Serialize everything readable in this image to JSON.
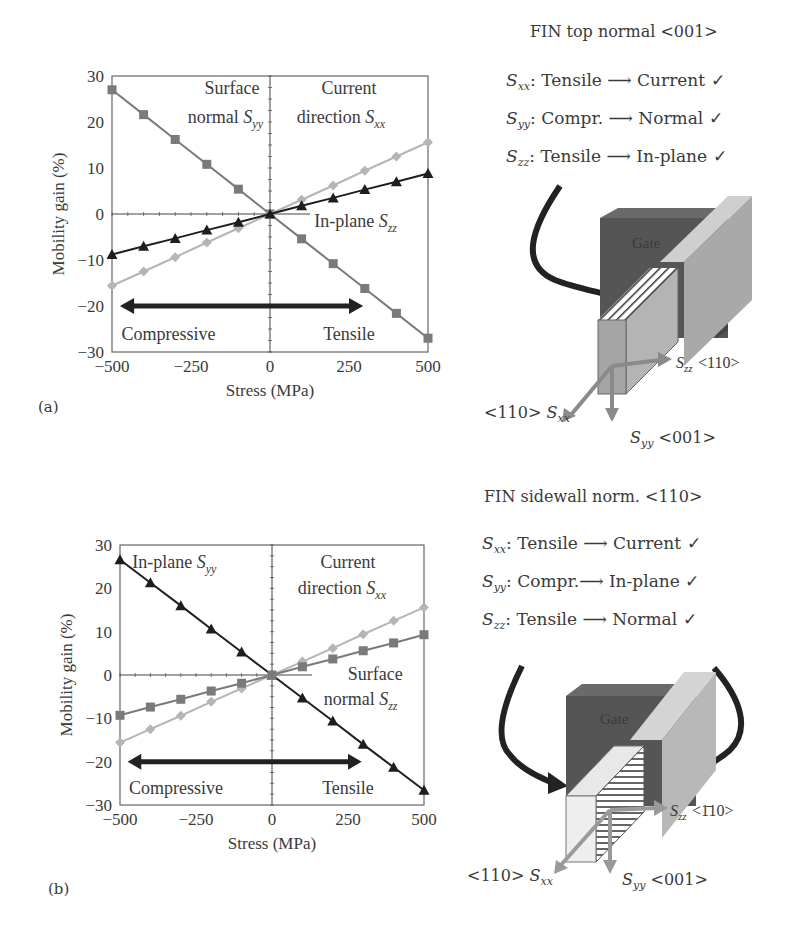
{
  "panels": [
    {
      "label": "(a)",
      "chart": {
        "ylabel": "Mobility gain (%)",
        "xlabel": "Stress (MPa)",
        "xticks": [
          "-500",
          "-250",
          "0",
          "250",
          "500"
        ],
        "yticks": [
          "30",
          "20",
          "10",
          "0",
          "-10",
          "-20",
          "-30"
        ],
        "annotations": {
          "upper_left_1": "Surface",
          "upper_left_2": "normal S",
          "upper_left_sub": "yy",
          "upper_right_1": "Current",
          "upper_right_2": "direction S",
          "upper_right_sub": "xx",
          "mid_right": "In-plane S",
          "mid_right_sub": "zz",
          "compressive": "Compressive",
          "tensile": "Tensile"
        }
      },
      "diagram": {
        "title": "FIN top normal <001>",
        "rules": [
          {
            "s": "S",
            "sub": "xx",
            "text": ": Tensile ⟶ Current ✓"
          },
          {
            "s": "S",
            "sub": "yy",
            "text": ": Compr. ⟶ Normal  ✓"
          },
          {
            "s": "S",
            "sub": "zz",
            "text": ": Tensile ⟶ In-plane ✓"
          }
        ],
        "gate_label": "Gate",
        "axis_zz": "<110>",
        "axis_xx": "<110>",
        "axis_yy": "<001>"
      }
    },
    {
      "label": "(b)",
      "chart": {
        "ylabel": "Mobility gain (%)",
        "xlabel": "Stress (MPa)",
        "xticks": [
          "-500",
          "-250",
          "0",
          "250",
          "500"
        ],
        "yticks": [
          "30",
          "20",
          "10",
          "0",
          "-10",
          "-20",
          "-30"
        ],
        "annotations": {
          "upper_left_1": "In-plane S",
          "upper_left_sub": "yy",
          "upper_right_1": "Current",
          "upper_right_2": "direction S",
          "upper_right_sub": "xx",
          "mid_right_1": "Surface",
          "mid_right_2": "normal S",
          "mid_right_sub": "zz",
          "compressive": "Compressive",
          "tensile": "Tensile"
        }
      },
      "diagram": {
        "title": "FIN sidewall norm. <110>",
        "rules": [
          {
            "s": "S",
            "sub": "xx",
            "text": ": Tensile ⟶ Current ✓"
          },
          {
            "s": "S",
            "sub": "yy",
            "text": ": Compr.⟶ In-plane ✓"
          },
          {
            "s": "S",
            "sub": "zz",
            "text": ": Tensile ⟶ Normal ✓"
          }
        ],
        "gate_label": "Gate",
        "axis_zz": "<1̄10>",
        "axis_xx": "<110>",
        "axis_yy": "<001>"
      }
    }
  ],
  "colors": {
    "sxx": "#b3b3b3",
    "syy_a": "#7a7a7a",
    "szz_a": "#1e1e1e",
    "arrow": "#222222",
    "gate": "#595959"
  },
  "chart_data": [
    {
      "type": "line",
      "title": "(a) FIN top normal <001>",
      "xlabel": "Stress (MPa)",
      "ylabel": "Mobility gain (%)",
      "xlim": [
        -500,
        500
      ],
      "ylim": [
        -30,
        30
      ],
      "x": [
        -500,
        -400,
        -300,
        -200,
        -100,
        0,
        100,
        200,
        300,
        400,
        500
      ],
      "series": [
        {
          "name": "Surface normal Syy",
          "marker": "square",
          "values": [
            27,
            21.6,
            16.2,
            10.8,
            5.4,
            0,
            -5.4,
            -10.8,
            -16.2,
            -21.6,
            -27
          ]
        },
        {
          "name": "Current direction Sxx",
          "marker": "diamond",
          "values": [
            -15.6,
            -12.5,
            -9.4,
            -6.2,
            -3.1,
            0,
            3.1,
            6.2,
            9.4,
            12.5,
            15.6
          ]
        },
        {
          "name": "In-plane Szz",
          "marker": "triangle",
          "values": [
            -8.8,
            -7.0,
            -5.3,
            -3.5,
            -1.8,
            0,
            1.8,
            3.5,
            5.3,
            7.0,
            8.8
          ]
        }
      ],
      "annotations": [
        "Compressive",
        "Tensile"
      ]
    },
    {
      "type": "line",
      "title": "(b) FIN sidewall norm. <110>",
      "xlabel": "Stress (MPa)",
      "ylabel": "Mobility gain (%)",
      "xlim": [
        -500,
        500
      ],
      "ylim": [
        -30,
        30
      ],
      "x": [
        -500,
        -400,
        -300,
        -200,
        -100,
        0,
        100,
        200,
        300,
        400,
        500
      ],
      "series": [
        {
          "name": "In-plane Syy",
          "marker": "triangle",
          "values": [
            26.6,
            21.3,
            16.0,
            10.6,
            5.3,
            0,
            -5.3,
            -10.6,
            -16.0,
            -21.3,
            -26.6
          ]
        },
        {
          "name": "Current direction Sxx",
          "marker": "diamond",
          "values": [
            -15.6,
            -12.5,
            -9.4,
            -6.2,
            -3.1,
            0,
            3.1,
            6.2,
            9.4,
            12.5,
            15.6
          ]
        },
        {
          "name": "Surface normal Szz",
          "marker": "square",
          "values": [
            -9.3,
            -7.4,
            -5.6,
            -3.7,
            -1.9,
            0,
            1.9,
            3.7,
            5.6,
            7.4,
            9.3
          ]
        }
      ],
      "annotations": [
        "Compressive",
        "Tensile"
      ]
    }
  ]
}
